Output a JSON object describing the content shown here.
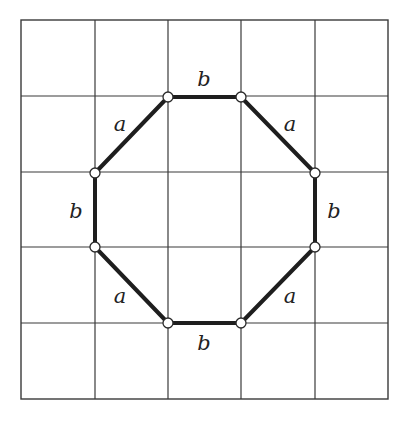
{
  "diagram": {
    "type": "octagon-on-grid",
    "grid": {
      "rows": 5,
      "cols": 5,
      "x_lines": [
        21,
        95,
        168,
        241,
        315,
        388
      ],
      "y_lines": [
        20,
        96,
        172,
        247,
        323,
        399
      ]
    },
    "vertices": [
      {
        "id": "v1",
        "x": 168,
        "y": 97
      },
      {
        "id": "v2",
        "x": 241,
        "y": 97
      },
      {
        "id": "v3",
        "x": 315,
        "y": 173
      },
      {
        "id": "v4",
        "x": 315,
        "y": 247
      },
      {
        "id": "v5",
        "x": 241,
        "y": 323
      },
      {
        "id": "v6",
        "x": 168,
        "y": 323
      },
      {
        "id": "v7",
        "x": 95,
        "y": 247
      },
      {
        "id": "v8",
        "x": 95,
        "y": 173
      }
    ],
    "edges": [
      {
        "from": "v1",
        "to": "v2",
        "label": "b",
        "label_x": 204,
        "label_y": 79
      },
      {
        "from": "v2",
        "to": "v3",
        "label": "a",
        "label_x": 290,
        "label_y": 124
      },
      {
        "from": "v3",
        "to": "v4",
        "label": "b",
        "label_x": 334,
        "label_y": 211
      },
      {
        "from": "v4",
        "to": "v5",
        "label": "a",
        "label_x": 290,
        "label_y": 296
      },
      {
        "from": "v5",
        "to": "v6",
        "label": "b",
        "label_x": 204,
        "label_y": 343
      },
      {
        "from": "v6",
        "to": "v7",
        "label": "a",
        "label_x": 120,
        "label_y": 296
      },
      {
        "from": "v7",
        "to": "v8",
        "label": "b",
        "label_x": 76,
        "label_y": 211
      },
      {
        "from": "v8",
        "to": "v1",
        "label": "a",
        "label_x": 120,
        "label_y": 124
      }
    ],
    "labels": {
      "top": "b",
      "top_right": "a",
      "right": "b",
      "bottom_right": "a",
      "bottom": "b",
      "bottom_left": "a",
      "left": "b",
      "top_left": "a"
    }
  }
}
